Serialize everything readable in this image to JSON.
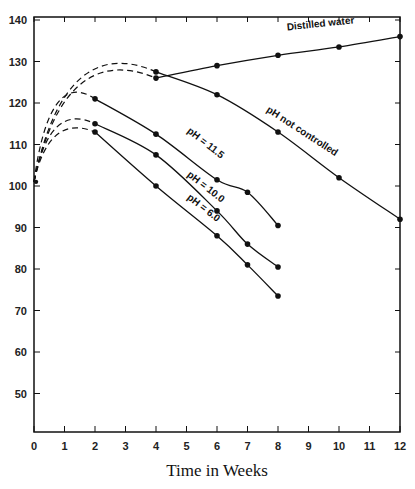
{
  "chart_data": {
    "type": "line",
    "title": "",
    "xlabel": "Time in Weeks",
    "ylabel": "",
    "xlim": [
      0,
      12
    ],
    "ylim": [
      40,
      140
    ],
    "x_ticks": [
      0,
      1,
      2,
      3,
      4,
      5,
      6,
      7,
      8,
      9,
      10,
      11,
      12
    ],
    "y_ticks": [
      50,
      60,
      70,
      80,
      90,
      100,
      110,
      120,
      130,
      140
    ],
    "grid": false,
    "legend": "inline labels along curves",
    "series": [
      {
        "name": "Distilled water",
        "points": [
          [
            0,
            101
          ],
          [
            4,
            126
          ],
          [
            6,
            129
          ],
          [
            8,
            131.5
          ],
          [
            10,
            133.5
          ],
          [
            12,
            136
          ]
        ],
        "dashed_segment": [
          0,
          4
        ],
        "label_pos": [
          8.3,
          137.5
        ],
        "label_angle": -6
      },
      {
        "name": "pH not controlled",
        "points": [
          [
            0,
            101
          ],
          [
            4,
            127.5
          ],
          [
            6,
            122
          ],
          [
            8,
            113
          ],
          [
            10,
            102
          ],
          [
            12,
            92
          ]
        ],
        "dashed_segment": [
          0,
          4
        ],
        "label_pos": [
          7.6,
          118
        ],
        "label_angle": 33
      },
      {
        "name": "pH = 11.5",
        "points": [
          [
            0,
            101
          ],
          [
            2,
            121
          ],
          [
            4,
            112.5
          ],
          [
            6,
            101.5
          ],
          [
            7,
            98.5
          ],
          [
            8,
            90.5
          ]
        ],
        "dashed_segment": [
          0,
          2
        ],
        "label_pos": [
          5.0,
          113
        ],
        "label_angle": 38
      },
      {
        "name": "pH = 10.0",
        "points": [
          [
            0,
            101
          ],
          [
            2,
            115
          ],
          [
            4,
            107.5
          ],
          [
            6,
            94
          ],
          [
            7,
            86
          ],
          [
            8,
            80.5
          ]
        ],
        "dashed_segment": [
          0,
          2
        ],
        "label_pos": [
          5.0,
          102.5
        ],
        "label_angle": 38
      },
      {
        "name": "pH = 6.0",
        "points": [
          [
            0,
            101
          ],
          [
            2,
            113
          ],
          [
            4,
            100
          ],
          [
            6,
            88
          ],
          [
            7,
            81
          ],
          [
            8,
            73.5
          ]
        ],
        "dashed_segment": [
          0,
          2
        ],
        "label_pos": [
          5.0,
          97
        ],
        "label_angle": 38
      }
    ]
  },
  "labels": {
    "xlabel": "Time in Weeks",
    "x_ticks": [
      "0",
      "1",
      "2",
      "3",
      "4",
      "5",
      "6",
      "7",
      "8",
      "9",
      "10",
      "11",
      "12"
    ],
    "y_ticks": [
      "50",
      "60",
      "70",
      "80",
      "90",
      "100",
      "110",
      "120",
      "130",
      "140"
    ],
    "series": [
      "Distilled water",
      "pH not controlled",
      "pH = 11.5",
      "pH = 10.0",
      "pH = 6.0"
    ]
  }
}
